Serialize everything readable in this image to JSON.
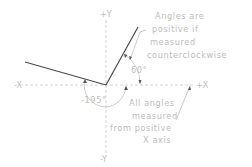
{
  "diagram": {
    "axes": {
      "pos_x": "+X",
      "neg_x": "-X",
      "pos_y": "+Y",
      "neg_y": "-Y"
    },
    "angles": {
      "positive": "60°",
      "negative": "-195°"
    },
    "notes": {
      "positive_note": [
        "Angles are",
        "positive if",
        "measured",
        "counterclockwise"
      ],
      "measured_note": [
        "All angles",
        "measured",
        "from positive",
        "X axis"
      ]
    },
    "colors": {
      "ray": "#4a4a4a",
      "text": "#bdbdbd",
      "axis": "#c8c8c8"
    }
  }
}
